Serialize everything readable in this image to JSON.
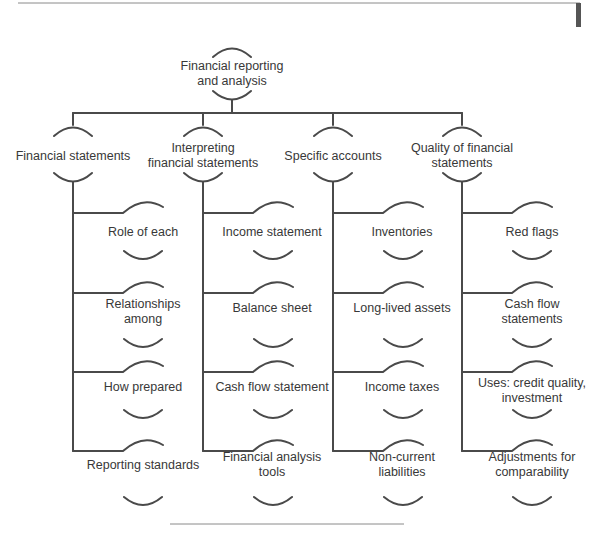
{
  "diagram": {
    "root": {
      "label_line1": "Financial reporting",
      "label_line2": "and analysis"
    },
    "columns": [
      {
        "label_line1": "Financial statements",
        "label_line2": "",
        "children": [
          {
            "line1": "Role of each",
            "line2": ""
          },
          {
            "line1": "Relationships",
            "line2": "among"
          },
          {
            "line1": "How prepared",
            "line2": ""
          },
          {
            "line1": "Reporting standards",
            "line2": ""
          }
        ]
      },
      {
        "label_line1": "Interpreting",
        "label_line2": "financial statements",
        "children": [
          {
            "line1": "Income statement",
            "line2": ""
          },
          {
            "line1": "Balance sheet",
            "line2": ""
          },
          {
            "line1": "Cash flow statement",
            "line2": ""
          },
          {
            "line1": "Financial analysis",
            "line2": "tools"
          }
        ]
      },
      {
        "label_line1": "Specific accounts",
        "label_line2": "",
        "children": [
          {
            "line1": "Inventories",
            "line2": ""
          },
          {
            "line1": "Long-lived assets",
            "line2": ""
          },
          {
            "line1": "Income taxes",
            "line2": ""
          },
          {
            "line1": "Non-current",
            "line2": "liabilities"
          }
        ]
      },
      {
        "label_line1": "Quality of financial",
        "label_line2": "statements",
        "children": [
          {
            "line1": "Red flags",
            "line2": ""
          },
          {
            "line1": "Cash flow",
            "line2": "statements"
          },
          {
            "line1": "Uses: credit quality,",
            "line2": "investment"
          },
          {
            "line1": "Adjustments for",
            "line2": "comparability"
          }
        ]
      }
    ]
  },
  "colors": {
    "line": "#4a4a4a",
    "rule": "#8a8a8a",
    "marker": "#555555"
  }
}
